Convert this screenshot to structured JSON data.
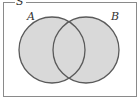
{
  "diagram": {
    "type": "venn",
    "universe": {
      "label": "S"
    },
    "sets": [
      {
        "label": "A",
        "shaded": true
      },
      {
        "label": "B",
        "shaded": true
      }
    ],
    "shaded_region": "A ∪ B",
    "caption": ""
  },
  "colors": {
    "background": "#ffffff",
    "frame": "#8a8a8a",
    "circle_fill": "#d9d9d9",
    "circle_stroke": "#5a5a5a",
    "label": "#333333"
  }
}
